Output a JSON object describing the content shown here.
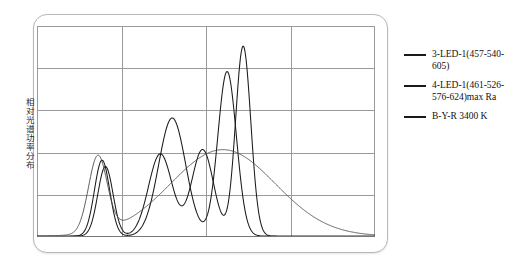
{
  "figure": {
    "y_axis_label": "相对光谱功率分布",
    "background_color": "#ffffff",
    "frame_color": "#b8b8b8",
    "grid_color": "#9a9a9a",
    "curve_color": "#1a1a1a"
  },
  "legend": {
    "entries": [
      {
        "label": "3-LED-1(457-540-605)",
        "color": "#1a1a1a"
      },
      {
        "label": "4-LED-1(461-526-576-624)max Ra",
        "color": "#1a1a1a"
      },
      {
        "label": "B-Y-R 3400 K",
        "color": "#1a1a1a"
      }
    ]
  },
  "chart_data": {
    "type": "line",
    "title": "",
    "xlabel": "",
    "ylabel": "相对光谱功率分布",
    "xlim": [
      380,
      780
    ],
    "ylim": [
      0,
      1
    ],
    "grid": true,
    "x_gridlines": [
      480,
      580,
      680
    ],
    "y_gridlines": [
      0.2,
      0.4,
      0.6,
      0.8,
      1.0
    ],
    "legend_position": "right",
    "series": [
      {
        "name": "3-LED-1(457-540-605)",
        "color": "#1a1a1a",
        "peaks": [
          {
            "x": 457,
            "y": 0.36
          },
          {
            "x": 540,
            "y": 0.56
          },
          {
            "x": 605,
            "y": 0.78
          }
        ]
      },
      {
        "name": "4-LED-1(461-526-576-624)max Ra",
        "color": "#1a1a1a",
        "peaks": [
          {
            "x": 461,
            "y": 0.33
          },
          {
            "x": 526,
            "y": 0.39
          },
          {
            "x": 576,
            "y": 0.41
          },
          {
            "x": 624,
            "y": 0.9
          }
        ]
      },
      {
        "name": "B-Y-R 3400 K",
        "color": "#4a4a4a",
        "peaks": [
          {
            "x": 452,
            "y": 0.36
          },
          {
            "x": 600,
            "y": 0.41
          }
        ]
      }
    ]
  }
}
